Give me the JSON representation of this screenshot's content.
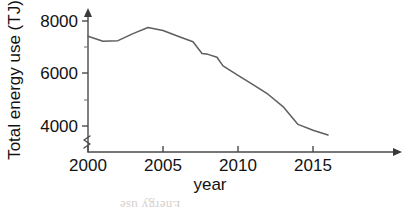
{
  "chart_data": {
    "type": "line",
    "title": "",
    "xlabel": "year",
    "ylabel": "Total energy use (TJ)",
    "xlim": [
      2000,
      2016.2
    ],
    "ylim": [
      3200,
      8200
    ],
    "grid": false,
    "legend": null,
    "axis_break": true,
    "x_ticks": [
      2000,
      2005,
      2010,
      2015
    ],
    "x_tick_labels": [
      "2000",
      "2005",
      "2010",
      "2015"
    ],
    "y_ticks": [
      4000,
      6000,
      8000
    ],
    "y_tick_labels": [
      "4000",
      "6000",
      "8000"
    ],
    "y_minor_ticks": [
      5000,
      7000
    ],
    "series": [
      {
        "name": "Total energy use",
        "color": "#5e5e5e",
        "x": [
          2000,
          2001,
          2002,
          2003,
          2004,
          2005,
          2006,
          2007,
          2007.6,
          2008,
          2008.6,
          2009,
          2010,
          2011,
          2012,
          2013,
          2014,
          2015,
          2016
        ],
        "values": [
          7420,
          7230,
          7250,
          7520,
          7750,
          7640,
          7420,
          7210,
          6760,
          6730,
          6620,
          6290,
          5930,
          5580,
          5210,
          4740,
          4060,
          3840,
          3660
        ]
      }
    ]
  },
  "labels": {
    "x_axis_title": "year",
    "y_axis_title": "Total energy use (TJ)"
  },
  "watermark": {
    "bleed_text": "Energy use"
  }
}
